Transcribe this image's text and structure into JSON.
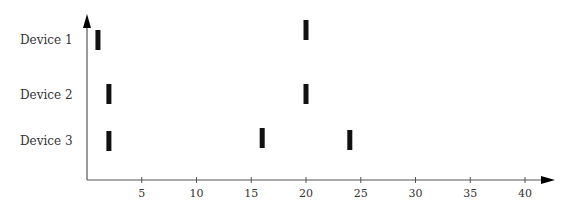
{
  "chart_data": {
    "type": "scatter",
    "title": "",
    "xlabel": "",
    "ylabel": "",
    "xlim": [
      0,
      42
    ],
    "x_ticks": [
      5,
      10,
      15,
      20,
      25,
      30,
      35,
      40
    ],
    "grid": false,
    "legend": null,
    "marker": "vertical-bar",
    "categories": [
      "Device 1",
      "Device 2",
      "Device 3"
    ],
    "series": [
      {
        "name": "Device 1",
        "x": [
          1,
          20
        ]
      },
      {
        "name": "Device 2",
        "x": [
          2,
          20
        ]
      },
      {
        "name": "Device 3",
        "x": [
          2,
          16,
          24
        ]
      }
    ]
  },
  "layout": {
    "axis_color": "#555555",
    "bar_color": "#111111",
    "label_color": "#333333",
    "origin_px": [
      87,
      180
    ],
    "px_per_unit": 10.95,
    "x_axis_end_px": 555,
    "y_axis_top_px": 14,
    "row_y_px": {
      "Device 1": [
        [
          30,
          50
        ],
        [
          20,
          40
        ]
      ],
      "Device 2": [
        [
          84,
          104
        ],
        [
          84,
          104
        ]
      ],
      "Device 3": [
        [
          131,
          151
        ],
        [
          128,
          148
        ],
        [
          130,
          150
        ]
      ]
    },
    "label_y_px": [
      44,
      99,
      145
    ]
  }
}
